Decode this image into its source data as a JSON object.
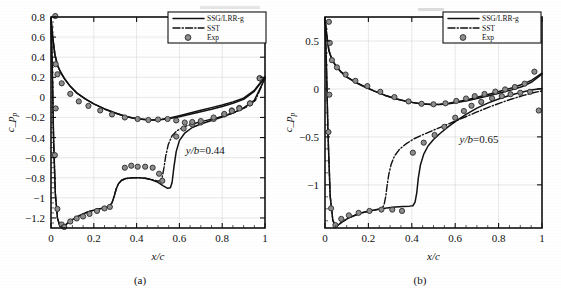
{
  "figure": {
    "panels": [
      {
        "caption": "(a)",
        "annotation": "y/b=0.44",
        "xlabel": "x/c",
        "ylabel": "c",
        "ylabel_sub": "p"
      },
      {
        "caption": "(b)",
        "annotation": "y/b=0.65",
        "xlabel": "x/c",
        "ylabel": "c",
        "ylabel_sub": "p"
      }
    ],
    "legend": {
      "entries": [
        {
          "label": "SSG/LRR-g",
          "style": "solid-line"
        },
        {
          "label": "SST",
          "style": "dash-dot-line"
        },
        {
          "label": "Exp",
          "style": "filled-circle-marker"
        }
      ]
    }
  },
  "chart_data": [
    {
      "type": "line",
      "title": "",
      "subplot_label": "(a)",
      "annotation": "y/b=0.44",
      "xlabel": "x/c",
      "ylabel": "c_p",
      "xlim": [
        0,
        1
      ],
      "ylim": [
        0.8,
        -1.3
      ],
      "y_axis_inverted": true,
      "xticks": [
        0,
        0.2,
        0.4,
        0.6,
        0.8,
        1
      ],
      "xticklabels": [
        "0",
        "0.2",
        "0.4",
        "0.6",
        "0.8",
        "1"
      ],
      "yticks": [
        -1.2,
        -1,
        -0.8,
        -0.6,
        -0.4,
        -0.2,
        0,
        0.2,
        0.4,
        0.6,
        0.8
      ],
      "yticklabels": [
        "-1.2",
        "-1",
        "-0.8",
        "-0.6",
        "-0.4",
        "-0.2",
        "0",
        "0.2",
        "0.4",
        "0.6",
        "0.8"
      ],
      "grid": true,
      "legend_position": "top-right",
      "series": [
        {
          "name": "SSG/LRR-g",
          "style": "solid",
          "x": [
            0.0,
            0.006,
            0.012,
            0.02,
            0.03,
            0.042,
            0.055,
            0.07,
            0.09,
            0.11,
            0.135,
            0.16,
            0.19,
            0.22,
            0.25,
            0.27,
            0.285,
            0.295,
            0.305,
            0.315,
            0.33,
            0.35,
            0.38,
            0.41,
            0.44,
            0.47,
            0.5,
            0.525,
            0.545,
            0.558,
            0.566,
            0.574,
            0.585,
            0.6,
            0.625,
            0.66,
            0.7,
            0.75,
            0.8,
            0.85,
            0.9,
            0.95,
            1.0
          ],
          "y": [
            0.79,
            0.3,
            -0.4,
            -0.95,
            -1.2,
            -1.285,
            -1.295,
            -1.265,
            -1.23,
            -1.205,
            -1.175,
            -1.15,
            -1.128,
            -1.112,
            -1.1,
            -1.09,
            -1.05,
            -0.985,
            -0.91,
            -0.86,
            -0.825,
            -0.808,
            -0.8,
            -0.8,
            -0.805,
            -0.82,
            -0.845,
            -0.88,
            -0.905,
            -0.9,
            -0.845,
            -0.7,
            -0.54,
            -0.43,
            -0.355,
            -0.3,
            -0.265,
            -0.23,
            -0.195,
            -0.155,
            -0.105,
            -0.03,
            0.19
          ]
        },
        {
          "name": "SST",
          "style": "dash-dot",
          "x": [
            0.0,
            0.006,
            0.012,
            0.02,
            0.03,
            0.042,
            0.055,
            0.07,
            0.09,
            0.11,
            0.135,
            0.16,
            0.19,
            0.22,
            0.25,
            0.27,
            0.285,
            0.295,
            0.305,
            0.315,
            0.33,
            0.35,
            0.38,
            0.41,
            0.44,
            0.47,
            0.495,
            0.51,
            0.52,
            0.528,
            0.536,
            0.548,
            0.565,
            0.59,
            0.625,
            0.665,
            0.71,
            0.76,
            0.81,
            0.86,
            0.91,
            0.955,
            1.0
          ],
          "y": [
            0.79,
            0.3,
            -0.4,
            -0.95,
            -1.2,
            -1.285,
            -1.295,
            -1.265,
            -1.23,
            -1.205,
            -1.175,
            -1.15,
            -1.128,
            -1.112,
            -1.1,
            -1.09,
            -1.05,
            -0.985,
            -0.91,
            -0.86,
            -0.825,
            -0.808,
            -0.8,
            -0.8,
            -0.805,
            -0.818,
            -0.832,
            -0.83,
            -0.79,
            -0.7,
            -0.585,
            -0.47,
            -0.385,
            -0.33,
            -0.29,
            -0.262,
            -0.238,
            -0.212,
            -0.182,
            -0.148,
            -0.1,
            -0.03,
            0.19
          ]
        },
        {
          "name": "SSG/LRR-g pressure side",
          "style": "solid",
          "x": [
            0.0,
            0.008,
            0.018,
            0.03,
            0.045,
            0.065,
            0.09,
            0.12,
            0.16,
            0.2,
            0.25,
            0.3,
            0.35,
            0.4,
            0.45,
            0.48,
            0.52,
            0.56,
            0.6,
            0.65,
            0.7,
            0.75,
            0.8,
            0.85,
            0.9,
            0.95,
            1.0
          ],
          "y": [
            0.79,
            0.6,
            0.43,
            0.32,
            0.25,
            0.18,
            0.11,
            0.045,
            -0.015,
            -0.065,
            -0.115,
            -0.155,
            -0.19,
            -0.212,
            -0.222,
            -0.224,
            -0.22,
            -0.208,
            -0.192,
            -0.168,
            -0.142,
            -0.118,
            -0.09,
            -0.058,
            -0.02,
            0.06,
            0.2
          ]
        },
        {
          "name": "SST pressure side",
          "style": "solid",
          "x": [
            0.0,
            0.008,
            0.018,
            0.03,
            0.045,
            0.065,
            0.09,
            0.12,
            0.16,
            0.2,
            0.25,
            0.3,
            0.35,
            0.4,
            0.45,
            0.48,
            0.52,
            0.56,
            0.6,
            0.65,
            0.7,
            0.75,
            0.8,
            0.85,
            0.9,
            0.95,
            1.0
          ],
          "y": [
            0.79,
            0.6,
            0.43,
            0.32,
            0.25,
            0.18,
            0.11,
            0.045,
            -0.015,
            -0.065,
            -0.115,
            -0.155,
            -0.19,
            -0.212,
            -0.222,
            -0.224,
            -0.218,
            -0.202,
            -0.182,
            -0.155,
            -0.128,
            -0.102,
            -0.075,
            -0.045,
            -0.008,
            0.07,
            0.205
          ]
        }
      ],
      "experiment": {
        "name": "Exp",
        "marker": "filled-circle",
        "x": [
          0.018,
          0.022,
          0.03,
          0.05,
          0.062,
          0.09,
          0.12,
          0.15,
          0.18,
          0.215,
          0.25,
          0.275,
          0.345,
          0.375,
          0.405,
          0.44,
          0.475,
          0.505,
          0.52,
          0.585,
          0.62,
          0.66,
          0.7,
          0.76,
          0.81,
          0.845,
          0.88,
          0.93,
          0.975,
          0.02,
          0.022,
          0.03,
          0.05,
          0.09,
          0.13,
          0.175,
          0.23,
          0.285,
          0.345,
          0.405,
          0.455,
          0.5,
          0.545,
          0.585,
          0.625,
          0.66,
          0.7,
          0.76,
          0.81,
          0.845,
          0.88,
          0.93,
          0.975
        ],
        "y": [
          -0.575,
          -0.11,
          -1.11,
          -1.265,
          -1.29,
          -1.235,
          -1.205,
          -1.185,
          -1.16,
          -1.13,
          -1.105,
          -1.09,
          -0.7,
          -0.68,
          -0.69,
          -0.69,
          -0.7,
          -0.76,
          -0.83,
          -0.39,
          -0.31,
          -0.27,
          -0.25,
          -0.215,
          -0.17,
          -0.13,
          -0.105,
          -0.06,
          0.19,
          0.81,
          0.33,
          0.23,
          0.14,
          0.035,
          -0.04,
          -0.085,
          -0.13,
          -0.17,
          -0.2,
          -0.215,
          -0.225,
          -0.22,
          -0.215,
          -0.23,
          -0.25,
          -0.245,
          -0.235,
          -0.2,
          -0.165,
          -0.135,
          -0.11,
          -0.06,
          0.19
        ]
      }
    },
    {
      "type": "line",
      "title": "",
      "subplot_label": "(b)",
      "annotation": "y/b=0.65",
      "xlabel": "x/c",
      "ylabel": "c_p",
      "xlim": [
        0,
        1
      ],
      "ylim": [
        0.75,
        -1.45
      ],
      "y_axis_inverted": true,
      "xticks": [
        0,
        0.2,
        0.4,
        0.6,
        0.8,
        1
      ],
      "xticklabels": [
        "0",
        "0.2",
        "0.4",
        "0.6",
        "0.8",
        "1"
      ],
      "yticks": [
        -1,
        -0.5,
        0,
        0.5
      ],
      "yticklabels": [
        "-1",
        "-0.5",
        "0",
        "0.5"
      ],
      "grid": true,
      "legend_position": "top-right",
      "series": [
        {
          "name": "SSG/LRR-g",
          "style": "solid",
          "x": [
            0.0,
            0.006,
            0.014,
            0.024,
            0.036,
            0.048,
            0.06,
            0.08,
            0.105,
            0.135,
            0.17,
            0.205,
            0.245,
            0.285,
            0.325,
            0.36,
            0.39,
            0.405,
            0.415,
            0.423,
            0.43,
            0.44,
            0.455,
            0.475,
            0.5,
            0.53,
            0.57,
            0.61,
            0.65,
            0.7,
            0.75,
            0.8,
            0.85,
            0.9,
            0.95,
            1.0
          ],
          "y": [
            0.74,
            0.3,
            -0.48,
            -1.12,
            -1.37,
            -1.43,
            -1.42,
            -1.385,
            -1.35,
            -1.32,
            -1.292,
            -1.272,
            -1.255,
            -1.242,
            -1.232,
            -1.225,
            -1.222,
            -1.218,
            -1.18,
            -1.08,
            -0.93,
            -0.79,
            -0.68,
            -0.595,
            -0.528,
            -0.465,
            -0.39,
            -0.325,
            -0.265,
            -0.2,
            -0.148,
            -0.105,
            -0.068,
            -0.038,
            -0.012,
            0.005
          ]
        },
        {
          "name": "SST",
          "style": "dash-dot",
          "x": [
            0.0,
            0.006,
            0.014,
            0.024,
            0.036,
            0.048,
            0.06,
            0.08,
            0.105,
            0.135,
            0.17,
            0.205,
            0.24,
            0.262,
            0.272,
            0.28,
            0.286,
            0.294,
            0.305,
            0.32,
            0.345,
            0.375,
            0.41,
            0.45,
            0.495,
            0.54,
            0.59,
            0.64,
            0.695,
            0.75,
            0.805,
            0.86,
            0.915,
            0.96,
            1.0
          ],
          "y": [
            0.74,
            0.3,
            -0.48,
            -1.12,
            -1.37,
            -1.43,
            -1.42,
            -1.385,
            -1.35,
            -1.32,
            -1.292,
            -1.272,
            -1.258,
            -1.25,
            -1.21,
            -1.12,
            -1.01,
            -0.89,
            -0.785,
            -0.7,
            -0.625,
            -0.57,
            -0.52,
            -0.478,
            -0.435,
            -0.392,
            -0.345,
            -0.298,
            -0.245,
            -0.195,
            -0.148,
            -0.105,
            -0.068,
            -0.04,
            -0.02
          ]
        },
        {
          "name": "SSG/LRR-g pressure side",
          "style": "solid",
          "x": [
            0.0,
            0.008,
            0.018,
            0.032,
            0.05,
            0.075,
            0.105,
            0.14,
            0.18,
            0.225,
            0.275,
            0.33,
            0.385,
            0.44,
            0.49,
            0.53,
            0.57,
            0.615,
            0.66,
            0.71,
            0.76,
            0.81,
            0.86,
            0.91,
            0.955,
            1.0
          ],
          "y": [
            0.74,
            0.56,
            0.4,
            0.305,
            0.24,
            0.175,
            0.118,
            0.07,
            0.025,
            -0.02,
            -0.065,
            -0.105,
            -0.135,
            -0.155,
            -0.162,
            -0.162,
            -0.155,
            -0.14,
            -0.12,
            -0.095,
            -0.068,
            -0.04,
            -0.01,
            0.025,
            0.075,
            0.155
          ]
        },
        {
          "name": "SST pressure side",
          "style": "solid",
          "x": [
            0.0,
            0.008,
            0.018,
            0.032,
            0.05,
            0.075,
            0.105,
            0.14,
            0.18,
            0.225,
            0.275,
            0.33,
            0.385,
            0.44,
            0.49,
            0.53,
            0.57,
            0.615,
            0.66,
            0.71,
            0.76,
            0.81,
            0.86,
            0.91,
            0.955,
            1.0
          ],
          "y": [
            0.74,
            0.56,
            0.4,
            0.305,
            0.24,
            0.175,
            0.118,
            0.07,
            0.025,
            -0.02,
            -0.065,
            -0.105,
            -0.135,
            -0.155,
            -0.162,
            -0.16,
            -0.15,
            -0.132,
            -0.11,
            -0.082,
            -0.052,
            -0.022,
            0.01,
            0.048,
            0.095,
            0.165
          ]
        }
      ],
      "experiment": {
        "name": "Exp",
        "marker": "filled-circle",
        "x": [
          0.016,
          0.02,
          0.028,
          0.048,
          0.075,
          0.11,
          0.155,
          0.205,
          0.26,
          0.31,
          0.355,
          0.405,
          0.455,
          0.505,
          0.55,
          0.6,
          0.64,
          0.675,
          0.72,
          0.77,
          0.815,
          0.855,
          0.9,
          0.945,
          0.985,
          0.018,
          0.022,
          0.032,
          0.055,
          0.095,
          0.14,
          0.195,
          0.255,
          0.32,
          0.385,
          0.445,
          0.5,
          0.555,
          0.605,
          0.65,
          0.69,
          0.735,
          0.785,
          0.83,
          0.875,
          0.92,
          0.965
        ],
        "y": [
          -0.45,
          -0.06,
          -1.245,
          -1.42,
          -1.355,
          -1.318,
          -1.292,
          -1.272,
          -1.258,
          -1.258,
          -1.272,
          -0.665,
          -0.56,
          -0.48,
          -0.395,
          -0.3,
          -0.23,
          -0.175,
          -0.135,
          -0.098,
          -0.075,
          -0.055,
          -0.04,
          -0.03,
          -0.225,
          0.7,
          0.48,
          0.3,
          0.225,
          0.15,
          0.085,
          0.03,
          -0.03,
          -0.085,
          -0.13,
          -0.155,
          -0.16,
          -0.15,
          -0.125,
          -0.1,
          -0.075,
          -0.052,
          -0.028,
          -0.005,
          0.02,
          0.055,
          0.18
        ]
      }
    }
  ]
}
